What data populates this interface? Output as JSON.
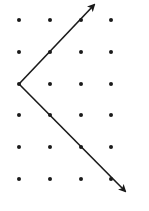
{
  "diagram": {
    "type": "dot-grid-with-arrows",
    "grid": {
      "columns": 4,
      "rows": 6,
      "col_x": [
        19,
        50,
        81,
        111
      ],
      "row_y": [
        20,
        52,
        84,
        115,
        147,
        179
      ],
      "dot_radius": 2,
      "dot_color": "#1a1a1a"
    },
    "vertex": {
      "x": 19,
      "y": 84
    },
    "arrows": [
      {
        "name": "upper-arrow",
        "from": {
          "x": 19,
          "y": 84
        },
        "to": {
          "x": 94,
          "y": 5
        },
        "color": "#1a1a1a"
      },
      {
        "name": "lower-arrow",
        "from": {
          "x": 19,
          "y": 84
        },
        "to": {
          "x": 125,
          "y": 191
        },
        "color": "#1a1a1a"
      }
    ]
  }
}
